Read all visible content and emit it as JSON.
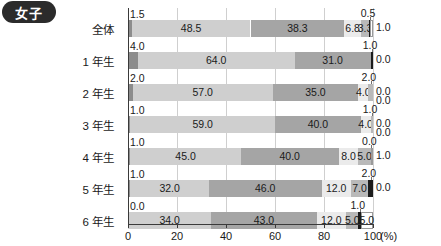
{
  "badge": {
    "label": "女子"
  },
  "axis": {
    "ticks": [
      "0",
      "20",
      "40",
      "60",
      "80",
      "100"
    ],
    "unit": "(%)",
    "min": 0,
    "max": 100
  },
  "colors": {
    "s1": "#8c8c8c",
    "s2": "#cfcfcf",
    "s3": "#a5a5a5",
    "s4": "#ebebeb",
    "s5": "#b9b9b9",
    "s6": "#1c1c1c",
    "s7": "#ffffff",
    "axis": "#3a3a3a",
    "grid": "#cfcfcf",
    "badge_bg": "#2b2b2b",
    "badge_fg": "#ffffff"
  },
  "chart_data": {
    "type": "bar",
    "orientation": "horizontal",
    "stacked": true,
    "title": "女子",
    "xlabel": "(%)",
    "ylabel": "",
    "xlim": [
      0,
      100
    ],
    "xticks": [
      0,
      20,
      40,
      60,
      80,
      100
    ],
    "grid": true,
    "legend": null,
    "categories": [
      "全体",
      "1 年生",
      "2 年生",
      "3 年生",
      "4 年生",
      "5 年生",
      "6 年生"
    ],
    "series": [
      {
        "name": "seg1",
        "values": [
          1.5,
          4.0,
          2.0,
          1.0,
          1.0,
          1.0,
          0.0
        ]
      },
      {
        "name": "seg2",
        "values": [
          48.5,
          64.0,
          57.0,
          59.0,
          45.0,
          32.0,
          34.0
        ]
      },
      {
        "name": "seg3",
        "values": [
          38.3,
          31.0,
          35.0,
          35.0,
          40.0,
          46.0,
          43.0
        ]
      },
      {
        "name": "seg4",
        "values": [
          6.8,
          0.0,
          4.0,
          4.0,
          8.0,
          12.0,
          12.0
        ]
      },
      {
        "name": "seg5",
        "values": [
          3.3,
          0.0,
          2.0,
          1.0,
          5.0,
          7.0,
          5.0
        ]
      },
      {
        "name": "seg6",
        "values": [
          0.5,
          1.0,
          0.0,
          0.0,
          0.0,
          2.0,
          1.0
        ]
      },
      {
        "name": "seg7",
        "values": [
          1.0,
          0.0,
          0.0,
          0.0,
          1.0,
          0.0,
          5.0
        ]
      }
    ]
  },
  "rows": [
    {
      "label": "全体",
      "top_label": "1.5",
      "segments": [
        {
          "value": 1.5,
          "text": "1.5",
          "show": "top",
          "color": "s1"
        },
        {
          "value": 48.5,
          "text": "48.5",
          "show": "in",
          "color": "s2"
        },
        {
          "value": 38.3,
          "text": "38.3",
          "show": "in",
          "color": "s3"
        },
        {
          "value": 6.8,
          "text": "6.8",
          "show": "in",
          "color": "s4"
        },
        {
          "value": 3.3,
          "text": "3.3",
          "show": "in",
          "color": "s5"
        },
        {
          "value": 0.5,
          "text": "0.5",
          "show": "top",
          "color": "s6"
        },
        {
          "value": 1.0,
          "text": "1.0",
          "show": "right",
          "color": "s7"
        }
      ]
    },
    {
      "label": "1 年生",
      "top_label": "4.0",
      "segments": [
        {
          "value": 4.0,
          "text": "4.0",
          "show": "top",
          "color": "s1"
        },
        {
          "value": 64.0,
          "text": "64.0",
          "show": "in",
          "color": "s2"
        },
        {
          "value": 31.0,
          "text": "31.0",
          "show": "in",
          "color": "s3"
        },
        {
          "value": 0.0,
          "text": "",
          "show": "none",
          "color": "s4"
        },
        {
          "value": 0.0,
          "text": "",
          "show": "none",
          "color": "s5"
        },
        {
          "value": 1.0,
          "text": "1.0",
          "show": "top",
          "color": "s6"
        },
        {
          "value": 0.0,
          "text": "0.0",
          "show": "right",
          "color": "s7"
        }
      ]
    },
    {
      "label": "2 年生",
      "top_label": "2.0",
      "segments": [
        {
          "value": 2.0,
          "text": "2.0",
          "show": "top",
          "color": "s1"
        },
        {
          "value": 57.0,
          "text": "57.0",
          "show": "in",
          "color": "s2"
        },
        {
          "value": 35.0,
          "text": "35.0",
          "show": "in",
          "color": "s3"
        },
        {
          "value": 4.0,
          "text": "4.0",
          "show": "in",
          "color": "s4"
        },
        {
          "value": 2.0,
          "text": "2.0",
          "show": "top",
          "color": "s5"
        },
        {
          "value": 0.0,
          "text": "0.0",
          "show": "right",
          "color": "s6"
        },
        {
          "value": 0.0,
          "text": "0.0",
          "show": "right2",
          "color": "s7"
        }
      ]
    },
    {
      "label": "3 年生",
      "top_label": "1.0",
      "segments": [
        {
          "value": 1.0,
          "text": "1.0",
          "show": "top",
          "color": "s1"
        },
        {
          "value": 59.0,
          "text": "59.0",
          "show": "in",
          "color": "s2"
        },
        {
          "value": 35.0,
          "text": "40.0",
          "show": "in",
          "color": "s3"
        },
        {
          "value": 4.0,
          "text": "4.0",
          "show": "in",
          "color": "s4"
        },
        {
          "value": 1.0,
          "text": "1.0",
          "show": "top",
          "color": "s5"
        },
        {
          "value": 0.0,
          "text": "0.0",
          "show": "right",
          "color": "s6"
        },
        {
          "value": 0.0,
          "text": "0.0",
          "show": "right2",
          "color": "s7"
        }
      ]
    },
    {
      "label": "4 年生",
      "top_label": "1.0",
      "segments": [
        {
          "value": 1.0,
          "text": "1.0",
          "show": "top",
          "color": "s1"
        },
        {
          "value": 45.0,
          "text": "45.0",
          "show": "in",
          "color": "s2"
        },
        {
          "value": 40.0,
          "text": "40.0",
          "show": "in",
          "color": "s3"
        },
        {
          "value": 8.0,
          "text": "8.0",
          "show": "in",
          "color": "s4"
        },
        {
          "value": 5.0,
          "text": "5.0",
          "show": "in",
          "color": "s5"
        },
        {
          "value": 0.0,
          "text": "0.0",
          "show": "top",
          "color": "s6"
        },
        {
          "value": 1.0,
          "text": "1.0",
          "show": "right",
          "color": "s7"
        }
      ]
    },
    {
      "label": "5 年生",
      "top_label": "1.0",
      "segments": [
        {
          "value": 1.0,
          "text": "1.0",
          "show": "top",
          "color": "s1"
        },
        {
          "value": 32.0,
          "text": "32.0",
          "show": "in",
          "color": "s2"
        },
        {
          "value": 46.0,
          "text": "46.0",
          "show": "in",
          "color": "s3"
        },
        {
          "value": 12.0,
          "text": "12.0",
          "show": "in",
          "color": "s4"
        },
        {
          "value": 7.0,
          "text": "7.0",
          "show": "in",
          "color": "s5"
        },
        {
          "value": 2.0,
          "text": "2.0",
          "show": "top",
          "color": "s6"
        },
        {
          "value": 0.0,
          "text": "0.0",
          "show": "right",
          "color": "s7"
        }
      ]
    },
    {
      "label": "6 年生",
      "top_label": "0.0",
      "segments": [
        {
          "value": 0.0,
          "text": "0.0",
          "show": "top",
          "color": "s1"
        },
        {
          "value": 34.0,
          "text": "34.0",
          "show": "in",
          "color": "s2"
        },
        {
          "value": 43.0,
          "text": "43.0",
          "show": "in",
          "color": "s3"
        },
        {
          "value": 12.0,
          "text": "12.0",
          "show": "in",
          "color": "s4"
        },
        {
          "value": 5.0,
          "text": "5.0",
          "show": "in",
          "color": "s5"
        },
        {
          "value": 1.0,
          "text": "1.0",
          "show": "top",
          "color": "s6"
        },
        {
          "value": 5.0,
          "text": "5.0",
          "show": "in",
          "color": "s7"
        }
      ]
    }
  ]
}
